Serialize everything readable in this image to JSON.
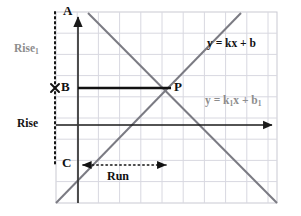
{
  "figure": {
    "colors": {
      "grid": "#d6d6de",
      "grid_border": "#c9c9d2",
      "axis": "#1a1a1a",
      "line_primary": "#7b7b83",
      "line_secondary": "#7b7b83",
      "segment": "#111111",
      "dotted": "#111111",
      "label_dark": "#111111",
      "label_gray": "#8d8d8d",
      "background": "#ffffff"
    },
    "grid": {
      "left": 56,
      "top": 12,
      "right": 277,
      "bottom": 203,
      "cell": 21.2,
      "visible": true
    },
    "axes": {
      "y_axis": {
        "x": 78,
        "top": 13,
        "bottom": 203,
        "arrow": "up"
      },
      "x_axis": {
        "y": 125,
        "left": 56,
        "right": 277,
        "arrow": "right"
      }
    },
    "points": [
      {
        "name": "A",
        "label": "A",
        "x": 78,
        "y": 13,
        "label_x": 63,
        "label_y": 5,
        "color": "dark"
      },
      {
        "name": "B",
        "label": "B",
        "x": 78,
        "y": 88,
        "label_x": 61,
        "label_y": 81,
        "color": "dark"
      },
      {
        "name": "C",
        "label": "C",
        "x": 78,
        "y": 165,
        "label_x": 62,
        "label_y": 157,
        "color": "dark"
      },
      {
        "name": "P",
        "label": "P",
        "x": 170,
        "y": 88,
        "label_x": 174,
        "label_y": 81,
        "color": "dark"
      }
    ],
    "x_marker": {
      "x": 55,
      "y": 88,
      "size": 6,
      "glyph": "x-marker"
    },
    "segments": {
      "bp": {
        "x1": 78,
        "y1": 88,
        "x2": 170,
        "y2": 88,
        "label": "B-to-P segment"
      }
    },
    "dotted": {
      "vertical_rise": {
        "x": 55,
        "y1": 12,
        "y2": 166
      },
      "run_arrow": {
        "x1": 81,
        "x2": 168,
        "y": 165,
        "arrows": "both"
      }
    },
    "lines": [
      {
        "id": "line-primary",
        "equation": "y = kx + b",
        "equation_label_x": 207,
        "equation_label_y": 44,
        "color": "dark",
        "slope_sign": "positive",
        "from": {
          "x": 56,
          "y": 203
        },
        "to": {
          "x": 241,
          "y": 13
        }
      },
      {
        "id": "line-secondary",
        "equation_prefix": "y = k",
        "equation_sub1": "1",
        "equation_mid": "x + b",
        "equation_sub2": "1",
        "equation": "y = k1x + b1",
        "equation_label_x": 205,
        "equation_label_y": 101,
        "color": "gray",
        "slope_sign": "negative",
        "from": {
          "x": 88,
          "y": 13
        },
        "to": {
          "x": 277,
          "y": 203
        }
      }
    ],
    "annotations": [
      {
        "id": "rise1",
        "text": "Rise",
        "sub": "1",
        "x": 14,
        "y": 49,
        "color": "gray"
      },
      {
        "id": "rise",
        "text": "Rise",
        "sub": "",
        "x": 17,
        "y": 119,
        "color": "dark"
      },
      {
        "id": "run",
        "text": "Run",
        "sub": "",
        "x": 107,
        "y": 171,
        "color": "dark"
      }
    ]
  }
}
